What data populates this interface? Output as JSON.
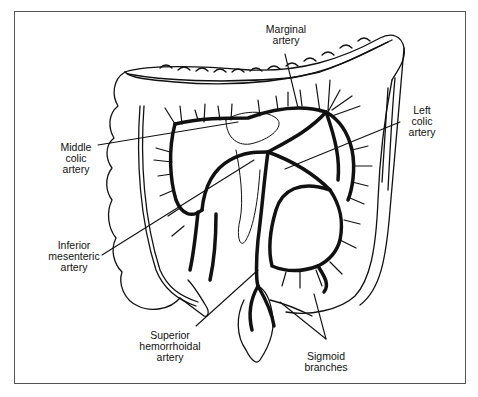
{
  "diagram": {
    "labels": {
      "marginal_artery": "Marginal\nartery",
      "left_colic_artery": "Left\ncolic\nartery",
      "middle_colic_artery": "Middle\ncolic\nartery",
      "inferior_mesenteric_artery": "Inferior\nmesenteric\nartery",
      "superior_hemorrhoidal_artery": "Superior\nhemorrhoidal\nartery",
      "sigmoid_branches": "Sigmoid\nbranches"
    },
    "colors": {
      "line": "#111111",
      "frame": "#555555",
      "background": "#ffffff"
    }
  }
}
